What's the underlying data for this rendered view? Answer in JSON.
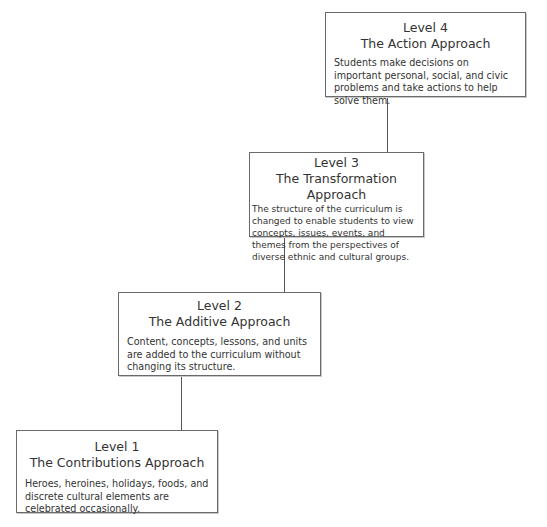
{
  "diagram": {
    "type": "staircase-hierarchy",
    "levels": [
      {
        "level": "Level 4",
        "name": "The Action Approach",
        "description": "Students make decisions on important personal, social, and civic problems and take actions to help solve them."
      },
      {
        "level": "Level 3",
        "name": "The Transformation Approach",
        "description": "The structure of the curriculum is changed to enable students to view concepts, issues, events, and themes from the perspectives of diverse ethnic and cultural groups."
      },
      {
        "level": "Level 2",
        "name": "The Additive Approach",
        "description": "Content, concepts, lessons, and units are added to the curriculum without changing its structure."
      },
      {
        "level": "Level 1",
        "name": "The Contributions Approach",
        "description": "Heroes, heroines, holidays, foods, and discrete cultural elements are celebrated occasionally."
      }
    ],
    "connections": [
      {
        "from": "Level 1",
        "to": "Level 2"
      },
      {
        "from": "Level 2",
        "to": "Level 3"
      },
      {
        "from": "Level 3",
        "to": "Level 4"
      }
    ],
    "colors": {
      "border": "#6a6a6a",
      "text": "#333333",
      "background": "#ffffff"
    }
  }
}
